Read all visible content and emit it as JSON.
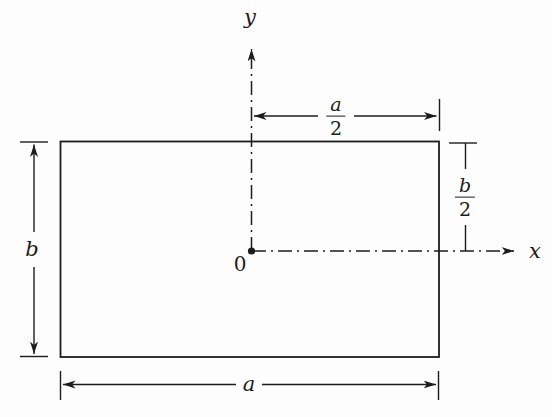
{
  "figure": {
    "colors": {
      "background": "#fdfdfd",
      "line": "#1c1c1c"
    },
    "labels": {
      "y_axis": "y",
      "x_axis": "x",
      "origin": "0",
      "width": "a",
      "height": "b",
      "half_width": {
        "numerator": "a",
        "denominator": "2"
      },
      "half_height": {
        "numerator": "b",
        "denominator": "2"
      }
    }
  }
}
